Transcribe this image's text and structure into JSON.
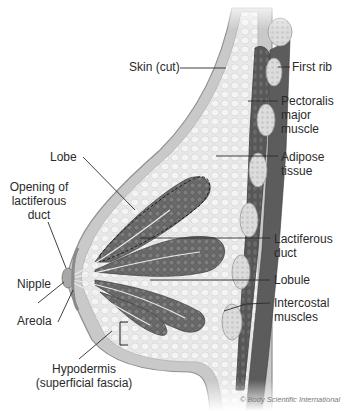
{
  "figure": {
    "colors": {
      "background": "#ffffff",
      "skin": "#c9c9c9",
      "skin_edge": "#8f8f8f",
      "adipose": "#e6e6e6",
      "lobe": "#6e6e6e",
      "lobe_dark": "#4f4f4f",
      "muscle": "#5a5a5a",
      "rib": "#d9d9d9",
      "leader_line": "#2a2a2a",
      "label_text": "#2a2a2a",
      "credit_text": "#7a7a7a"
    }
  },
  "labels": {
    "skin_cut": "Skin (cut)",
    "first_rib": "First rib",
    "pectoralis_1": "Pectoralis",
    "pectoralis_2": "major",
    "pectoralis_3": "muscle",
    "adipose_1": "Adipose",
    "adipose_2": "tissue",
    "lobe": "Lobe",
    "opening_1": "Opening of",
    "opening_2": "lactiferous",
    "opening_3": "duct",
    "lactiferous_1": "Lactiferous",
    "lactiferous_2": "duct",
    "nipple": "Nipple",
    "lobule": "Lobule",
    "areola": "Areola",
    "intercostal_1": "Intercostal",
    "intercostal_2": "muscles",
    "hypodermis_1": "Hypodermis",
    "hypodermis_2": "(superficial fascia)"
  },
  "credit": "© Body Scientific International"
}
